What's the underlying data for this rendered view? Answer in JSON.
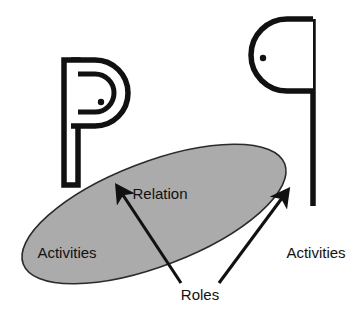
{
  "diagram": {
    "background_color": "#ffffff",
    "stroke_color": "#111111",
    "ellipse_fill_color": "#ababab",
    "labels": {
      "relation": "Relation",
      "activities_left": "Activities",
      "activities_right": "Activities",
      "roles": "Roles"
    },
    "shapes": [
      {
        "name": "actor-left",
        "kind": "flag-head-post",
        "description": "P-shaped pictogram: vertical post on the left with rounded head opening to the right, containing a dot"
      },
      {
        "name": "actor-right",
        "kind": "flag-head-post-mirrored",
        "description": "q-shaped pictogram: vertical post on the right with rounded head opening to the left, containing a dot"
      },
      {
        "name": "relation-ellipse",
        "kind": "ellipse",
        "fill": "#ababab",
        "rotation_degrees": -21
      }
    ],
    "connectors": [
      {
        "name": "roles-arrow-left",
        "from": "roles-label",
        "to": "relation-ellipse"
      },
      {
        "name": "roles-arrow-right",
        "from": "roles-label",
        "to": "relation-ellipse"
      }
    ]
  }
}
